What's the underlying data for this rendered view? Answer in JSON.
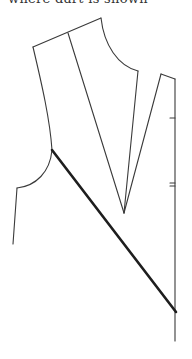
{
  "caption": {
    "text": "where dart is shown"
  },
  "diagram": {
    "type": "sewing-pattern-bodice",
    "colors": {
      "line": "#3a3a3a",
      "slash": "#1e1e1e",
      "background": "#ffffff"
    },
    "points": {
      "shoulder_left": [
        33,
        47
      ],
      "dart_top": [
        68,
        33
      ],
      "neck_top": [
        101,
        18
      ],
      "neck_bottom": [
        138,
        71
      ],
      "dart_apex": [
        124,
        213
      ],
      "right_piece_top": [
        161,
        74
      ],
      "center_front_top": [
        175,
        79
      ],
      "armhole_point": [
        52,
        150
      ],
      "side_top": [
        17,
        188
      ],
      "side_bottom": [
        13,
        244
      ],
      "slash_end": [
        176,
        312
      ],
      "center_front_bottom": [
        175,
        341
      ]
    },
    "marks": [
      {
        "name": "notch-single",
        "y": 118
      },
      {
        "name": "notch-double",
        "y": [
          183,
          186
        ]
      }
    ]
  }
}
